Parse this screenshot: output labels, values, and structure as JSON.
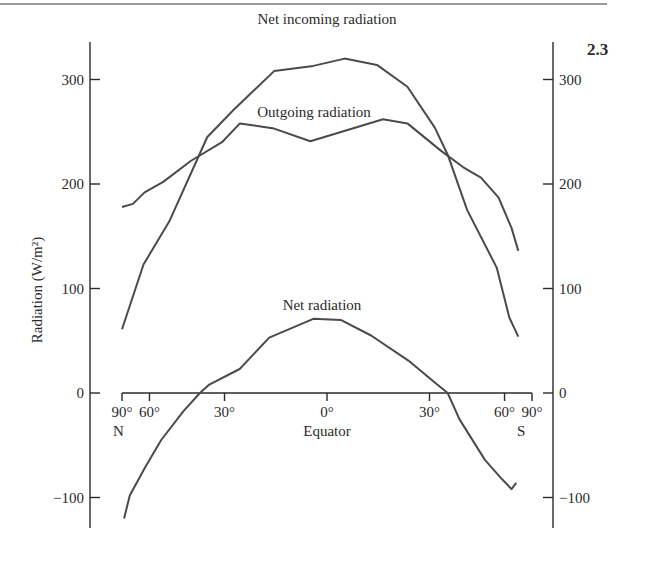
{
  "figure_number": "2.3",
  "chart_data": {
    "type": "line",
    "title": "",
    "xlabel": "Equator",
    "ylabel": "Radiation (W/m²)",
    "x_scale": "sine of latitude (area-weighted), -1 = 90°N, +1 = 90°S",
    "xlim": [
      -1,
      1
    ],
    "ylim": [
      -130,
      340
    ],
    "yticks": [
      300,
      200,
      100,
      0,
      -100
    ],
    "ytick_labels": [
      "300",
      "200",
      "100",
      "0",
      "−100"
    ],
    "xticks": [
      {
        "lat": -90,
        "label": "90°"
      },
      {
        "lat": -60,
        "label": "60°"
      },
      {
        "lat": -30,
        "label": "30°"
      },
      {
        "lat": 0,
        "label": "0°"
      },
      {
        "lat": 30,
        "label": "30°"
      },
      {
        "lat": 60,
        "label": "60°"
      },
      {
        "lat": 90,
        "label": "90°"
      }
    ],
    "hemisphere_labels": {
      "north": "N",
      "south": "S"
    },
    "grid": false,
    "series": [
      {
        "name": "Net incoming radiation",
        "x": [
          -1.0,
          -0.895,
          -0.77,
          -0.584,
          -0.455,
          -0.258,
          -0.067,
          0.086,
          0.244,
          0.392,
          0.526,
          0.589,
          0.684,
          0.828,
          0.89,
          0.933
        ],
        "values": [
          61,
          123,
          164,
          245,
          271,
          308,
          313,
          320,
          314,
          293,
          254,
          228,
          175,
          120,
          72,
          54
        ]
      },
      {
        "name": "Outgoing radiation",
        "x": [
          -1.0,
          -0.947,
          -0.89,
          -0.799,
          -0.665,
          -0.512,
          -0.425,
          -0.258,
          -0.081,
          0.273,
          0.392,
          0.555,
          0.665,
          0.751,
          0.837,
          0.9,
          0.933
        ],
        "values": [
          178,
          181,
          192,
          202,
          222,
          240,
          258,
          253,
          241,
          262,
          258,
          232,
          216,
          206,
          187,
          158,
          136
        ]
      },
      {
        "name": "Net radiation",
        "x": [
          -0.99,
          -0.962,
          -0.89,
          -0.809,
          -0.699,
          -0.62,
          -0.574,
          -0.426,
          -0.282,
          -0.067,
          0.067,
          0.215,
          0.397,
          0.526,
          0.589,
          0.646,
          0.77,
          0.847,
          0.9,
          0.923
        ],
        "values": [
          -120,
          -98,
          -72,
          -45,
          -17,
          0,
          8,
          23,
          53,
          71,
          70,
          55,
          31,
          10,
          0,
          -25,
          -64,
          -81,
          -92,
          -86
        ]
      }
    ]
  }
}
